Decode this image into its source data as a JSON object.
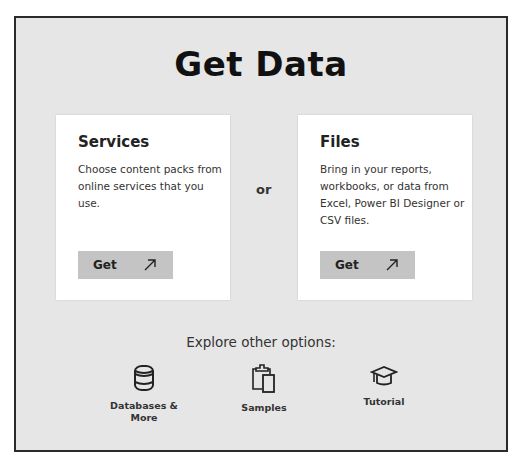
{
  "page": {
    "title": "Get Data"
  },
  "cards": [
    {
      "title": "Services",
      "description": "Choose content packs from online services that you use.",
      "button_label": "Get",
      "button_icon": "arrow-up-right-icon"
    },
    {
      "title": "Files",
      "description": "Bring in your reports, workbooks, or data from Excel, Power BI Designer or CSV files.",
      "button_label": "Get",
      "button_icon": "arrow-up-right-icon"
    }
  ],
  "separator": "or",
  "explore": {
    "heading": "Explore other options:",
    "options": [
      {
        "label": "Databases & More",
        "icon": "database-icon"
      },
      {
        "label": "Samples",
        "icon": "clipboard-icon"
      },
      {
        "label": "Tutorial",
        "icon": "graduation-cap-icon"
      }
    ]
  },
  "colors": {
    "background": "#e6e6e6",
    "card": "#ffffff",
    "button": "#c4c4c4",
    "border": "#2a2a2a",
    "text": "#222222"
  }
}
